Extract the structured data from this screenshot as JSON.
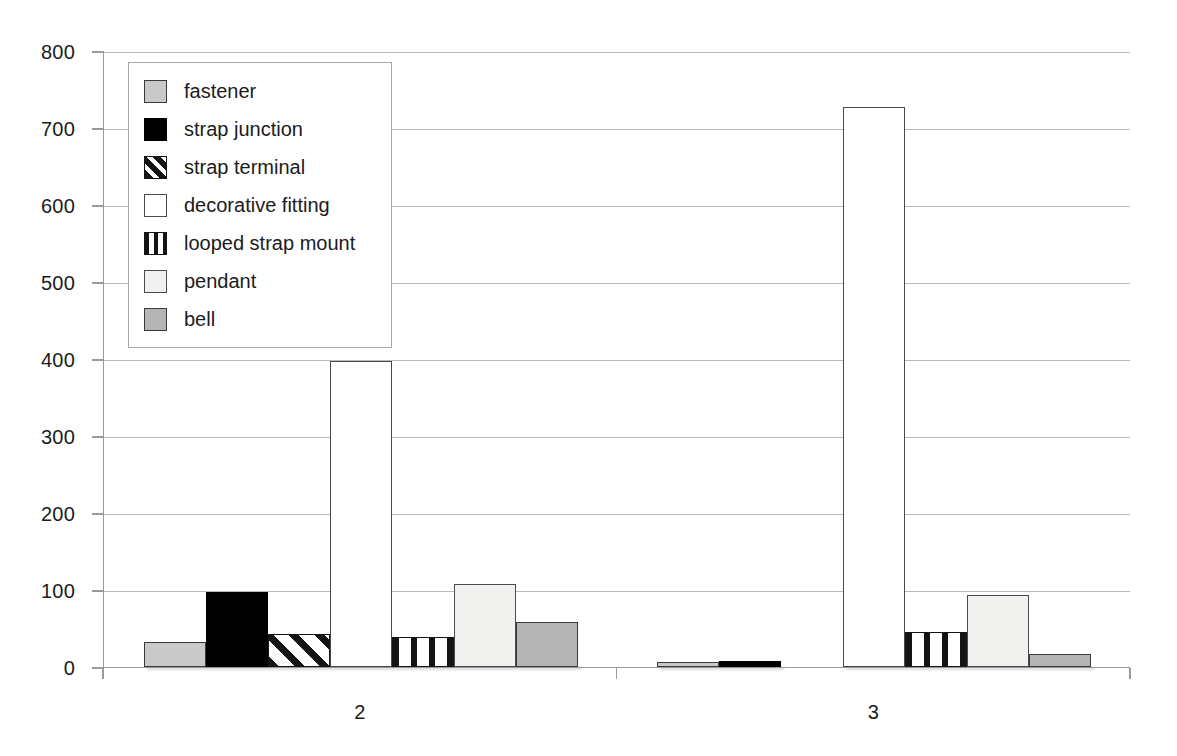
{
  "chart_data": {
    "type": "bar",
    "title": "",
    "subtitle": "",
    "xlabel": "",
    "ylabel": "",
    "categories": [
      "2",
      "3"
    ],
    "ylim": [
      0,
      800
    ],
    "ytick_step": 100,
    "yticks": [
      "800",
      "700",
      "600",
      "500",
      "400",
      "300",
      "200",
      "100",
      "0"
    ],
    "grid": "horizontal",
    "legend_position": "upper-left-inside",
    "series": [
      {
        "name": "fastener",
        "values": [
          33,
          7
        ],
        "swatch": "solid-grey-dark",
        "color": "#c9c9c9"
      },
      {
        "name": "strap junction",
        "values": [
          98,
          8
        ],
        "swatch": "solid-black",
        "color": "#000000"
      },
      {
        "name": "strap terminal",
        "values": [
          43,
          0
        ],
        "swatch": "diagonal-hatch",
        "color": "#ffffff"
      },
      {
        "name": "decorative fitting",
        "values": [
          397,
          727
        ],
        "swatch": "open-white",
        "color": "#ffffff"
      },
      {
        "name": "looped strap mount",
        "values": [
          39,
          46
        ],
        "swatch": "vertical-hatch",
        "color": "#ffffff"
      },
      {
        "name": "pendant",
        "values": [
          108,
          93
        ],
        "swatch": "solid-offwhite",
        "color": "#f0f0ee"
      },
      {
        "name": "bell",
        "values": [
          59,
          17
        ],
        "swatch": "solid-grey-mid",
        "color": "#b4b4b4"
      }
    ]
  },
  "axis": {
    "y_tick_labels": [
      "800",
      "700",
      "600",
      "500",
      "400",
      "300",
      "200",
      "100",
      "0"
    ],
    "x_tick_labels": [
      "2",
      "3"
    ]
  },
  "legend": {
    "items": [
      {
        "label": "fastener"
      },
      {
        "label": "strap junction"
      },
      {
        "label": "strap terminal"
      },
      {
        "label": "decorative fitting"
      },
      {
        "label": "looped strap mount"
      },
      {
        "label": "pendant"
      },
      {
        "label": "bell"
      }
    ]
  },
  "colors": {
    "grid": "#b9b9b9",
    "axis": "#9a9a9a",
    "text": "#1b1b1b",
    "background": "#ffffff"
  }
}
